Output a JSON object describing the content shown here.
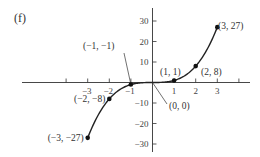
{
  "panel_label": "(f)",
  "chart_data": {
    "type": "line",
    "title": "",
    "function": "y = x^3",
    "xlabel": "",
    "ylabel": "",
    "x_ticks": [
      -3,
      -2,
      -1,
      1,
      2,
      3
    ],
    "x_tick_labels": [
      "−3",
      "−2",
      "−1",
      "1",
      "2",
      "3"
    ],
    "y_ticks": [
      30,
      20,
      10,
      -10,
      -20,
      -30
    ],
    "y_tick_labels": [
      "30",
      "20",
      "10",
      "−10",
      "−20",
      "−30"
    ],
    "xlim": [
      -3.5,
      3.5
    ],
    "ylim": [
      -30,
      30
    ],
    "grid": false,
    "legend": null,
    "points": [
      {
        "x": -3,
        "y": -27,
        "label": "(−3, −27)"
      },
      {
        "x": -2,
        "y": -8,
        "label": "(−2, −8)"
      },
      {
        "x": -1,
        "y": -1,
        "label": "(−1, −1)"
      },
      {
        "x": 0,
        "y": 0,
        "label": "(0, 0)"
      },
      {
        "x": 1,
        "y": 1,
        "label": "(1, 1)"
      },
      {
        "x": 2,
        "y": 8,
        "label": "(2, 8)"
      },
      {
        "x": 3,
        "y": 27,
        "label": "(3, 27)"
      }
    ]
  },
  "colors": {
    "curve": "#222222",
    "axis": "#333333",
    "text": "#333333"
  }
}
